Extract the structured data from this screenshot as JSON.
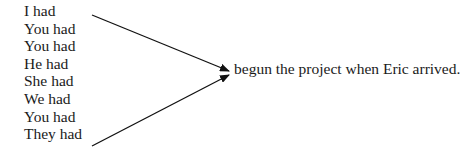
{
  "diagram": {
    "subjects": [
      "I had",
      "You had",
      "You had",
      "He had",
      "She had",
      "We had",
      "You had",
      "They had"
    ],
    "predicate": "begun the project when Eric arrived.",
    "arrows": [
      {
        "from": "top-left",
        "to": "predicate"
      },
      {
        "from": "bottom-left",
        "to": "predicate"
      }
    ]
  }
}
